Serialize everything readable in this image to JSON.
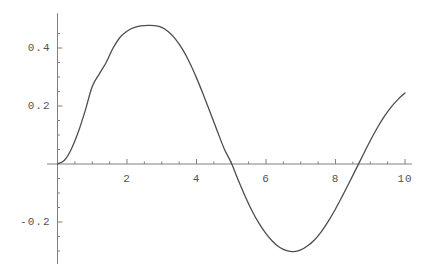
{
  "chart_data": {
    "type": "line",
    "title": "",
    "subtitle": "",
    "xlabel": "",
    "ylabel": "",
    "xlim": [
      -0.3,
      10.2
    ],
    "ylim": [
      -0.345,
      0.52
    ],
    "grid": false,
    "legend": null,
    "axis_color": "#808080",
    "curve_color": "#4d4d4d",
    "background_color": "#ffffff",
    "x_ticks_major": [
      2,
      4,
      6,
      8,
      10
    ],
    "x_tick_labels": [
      "2",
      "4",
      "6",
      "8",
      "10"
    ],
    "x_ticks_minor": [
      0.5,
      1,
      1.5,
      2.5,
      3,
      3.5,
      4.5,
      5,
      5.5,
      6.5,
      7,
      7.5,
      8.5,
      9,
      9.5
    ],
    "y_ticks_major": [
      0.4,
      0.2,
      -0.2
    ],
    "y_tick_labels": [
      "0.4",
      "0.2",
      "-0.2"
    ],
    "y_ticks_minor": [
      0.05,
      0.1,
      0.15,
      0.25,
      0.3,
      0.35,
      0.45,
      -0.05,
      -0.1,
      -0.15,
      -0.25,
      -0.3
    ],
    "annotations": [],
    "series": [
      {
        "name": "curve",
        "x": [
          0.0,
          0.2,
          0.4,
          0.6,
          0.8,
          1.0,
          1.2,
          1.4,
          1.6,
          1.8,
          2.0,
          2.2,
          2.4,
          2.6,
          2.8,
          3.0,
          3.2,
          3.4,
          3.6,
          3.8,
          4.0,
          4.2,
          4.4,
          4.6,
          4.8,
          5.0,
          5.2,
          5.4,
          5.6,
          5.8,
          6.0,
          6.2,
          6.4,
          6.6,
          6.8,
          7.0,
          7.2,
          7.4,
          7.6,
          7.8,
          8.0,
          8.2,
          8.4,
          8.6,
          8.8,
          9.0,
          9.2,
          9.4,
          9.6,
          9.8,
          10.0
        ],
        "y": [
          0.0,
          0.013,
          0.052,
          0.111,
          0.185,
          0.267,
          0.31,
          0.35,
          0.4,
          0.437,
          0.458,
          0.47,
          0.476,
          0.478,
          0.477,
          0.471,
          0.455,
          0.43,
          0.395,
          0.35,
          0.297,
          0.238,
          0.176,
          0.113,
          0.052,
          0.004,
          -0.055,
          -0.111,
          -0.162,
          -0.205,
          -0.24,
          -0.268,
          -0.288,
          -0.299,
          -0.302,
          -0.296,
          -0.282,
          -0.261,
          -0.232,
          -0.196,
          -0.155,
          -0.11,
          -0.063,
          -0.015,
          0.033,
          0.08,
          0.124,
          0.163,
          0.196,
          0.223,
          0.245
        ]
      }
    ]
  },
  "axes": {
    "x_axis_name": "horizontal-axis",
    "y_axis_name": "vertical-axis"
  }
}
